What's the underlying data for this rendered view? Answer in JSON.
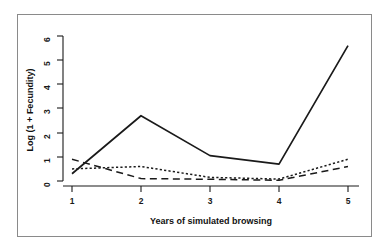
{
  "figure": {
    "background_color": "#ffffff",
    "frame_color": "#8a8a8a",
    "line_color": "#1a1a1a"
  },
  "axes": {
    "x_title": "Years of simulated browsing",
    "y_title": "Log (1 + Fecundity)",
    "x_ticks": [
      "1",
      "2",
      "3",
      "4",
      "5"
    ],
    "y_ticks": [
      "0",
      "1",
      "2",
      "3",
      "4",
      "5",
      "6"
    ]
  },
  "chart_data": {
    "type": "line",
    "title": "",
    "xlabel": "Years of simulated browsing",
    "ylabel": "Log (1 + Fecundity)",
    "x": [
      1,
      2,
      3,
      4,
      5
    ],
    "xlim": [
      0.75,
      5.25
    ],
    "ylim": [
      0,
      6
    ],
    "xticks": [
      1,
      2,
      3,
      4,
      5
    ],
    "yticks": [
      0,
      1,
      2,
      3,
      4,
      5,
      6
    ],
    "grid": false,
    "legend": "none",
    "series": [
      {
        "name": "solid-series",
        "style": "solid",
        "color": "#1a1a1a",
        "values": [
          0.3,
          2.7,
          1.05,
          0.7,
          5.6
        ]
      },
      {
        "name": "dotted-series",
        "style": "dotted",
        "color": "#1a1a1a",
        "values": [
          0.5,
          0.6,
          0.15,
          0.08,
          0.9
        ]
      },
      {
        "name": "dashed-series",
        "style": "dashed",
        "color": "#1a1a1a",
        "values": [
          0.9,
          0.1,
          0.07,
          0.03,
          0.6
        ]
      }
    ]
  }
}
